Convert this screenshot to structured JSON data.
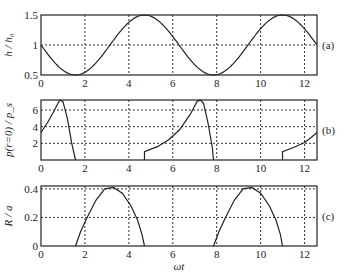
{
  "chart_data": [
    {
      "type": "line",
      "panel_tag": "(a)",
      "ylabel": "h / h₀",
      "xlabel": "",
      "xlim": [
        0,
        12.566
      ],
      "ylim": [
        0.5,
        1.5
      ],
      "xticks": [
        "0",
        "2",
        "4",
        "6",
        "8",
        "10",
        "12"
      ],
      "xtick_values": [
        0,
        2,
        4,
        6,
        8,
        10,
        12
      ],
      "yticks": [
        "0.5",
        "1",
        "1.5"
      ],
      "ytick_values": [
        0.5,
        1,
        1.5
      ],
      "grid": true,
      "series": [
        {
          "name": "h/h0",
          "formula": "1 - 0.5*sin(x)",
          "x": [
            0,
            1,
            1.571,
            2,
            3,
            3.14,
            4,
            4.712,
            5,
            6,
            6.283,
            7,
            7.854,
            8,
            9,
            9.42,
            10,
            11,
            11,
            12,
            12.566
          ],
          "y": [
            1,
            0.579,
            0.5,
            0.545,
            0.929,
            1,
            1.378,
            1.5,
            1.479,
            1.14,
            1,
            0.672,
            0.5,
            0.505,
            0.794,
            1,
            1.272,
            1.5,
            1.5,
            1.268,
            1
          ]
        }
      ]
    },
    {
      "type": "line",
      "panel_tag": "(b)",
      "ylabel": "p(r=0) / p_s",
      "xlabel": "",
      "xlim": [
        0,
        12.566
      ],
      "ylim": [
        0,
        7.2
      ],
      "xticks": [
        "0",
        "2",
        "4",
        "6",
        "8",
        "10",
        "12"
      ],
      "xtick_values": [
        0,
        2,
        4,
        6,
        8,
        10,
        12
      ],
      "yticks": [
        "2",
        "4",
        "6"
      ],
      "ytick_values": [
        2,
        4,
        6
      ],
      "grid": true,
      "series": [
        {
          "name": "segment-1",
          "x": [
            0,
            0.3,
            0.6,
            0.85,
            1.0,
            1.2,
            1.4,
            1.571
          ],
          "y": [
            3.3,
            4.5,
            5.9,
            7.2,
            7.0,
            5.0,
            2.0,
            0
          ]
        },
        {
          "name": "segment-2",
          "x": [
            4.712,
            4.712,
            5.3,
            5.8,
            6.3,
            6.8,
            7.1,
            7.25,
            7.4,
            7.6,
            7.8,
            7.854
          ],
          "y": [
            0,
            1.0,
            1.6,
            2.4,
            3.6,
            5.5,
            7.0,
            7.2,
            6.8,
            4.5,
            1.5,
            0
          ]
        },
        {
          "name": "segment-3",
          "x": [
            10.996,
            10.996,
            11.5,
            12.0,
            12.3,
            12.566
          ],
          "y": [
            0,
            1.0,
            1.5,
            2.1,
            2.7,
            3.3
          ]
        }
      ]
    },
    {
      "type": "line",
      "panel_tag": "(c)",
      "ylabel": "R / a",
      "xlabel": "ωt",
      "xlim": [
        0,
        12.566
      ],
      "ylim": [
        0,
        0.42
      ],
      "xticks": [
        "0",
        "2",
        "4",
        "6",
        "8",
        "10",
        "12"
      ],
      "xtick_values": [
        0,
        2,
        4,
        6,
        8,
        10,
        12
      ],
      "yticks": [
        "0",
        "0.2",
        "0.4"
      ],
      "ytick_values": [
        0,
        0.2,
        0.4
      ],
      "grid": true,
      "series": [
        {
          "name": "segment-1",
          "x": [
            1.571,
            1.8,
            2.1,
            2.5,
            2.9,
            3.3,
            3.7,
            4.1,
            4.4,
            4.6,
            4.712
          ],
          "y": [
            0,
            0.1,
            0.2,
            0.32,
            0.4,
            0.41,
            0.37,
            0.28,
            0.18,
            0.08,
            0
          ]
        },
        {
          "name": "segment-2",
          "x": [
            7.854,
            8.1,
            8.4,
            8.8,
            9.2,
            9.6,
            10.0,
            10.4,
            10.7,
            10.9,
            10.996
          ],
          "y": [
            0,
            0.1,
            0.2,
            0.32,
            0.4,
            0.41,
            0.37,
            0.28,
            0.18,
            0.08,
            0
          ]
        }
      ]
    }
  ]
}
